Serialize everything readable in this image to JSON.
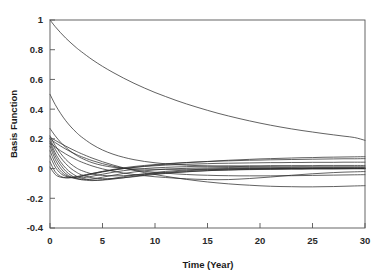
{
  "chart_data": {
    "type": "line",
    "title": "",
    "xlabel": "Time (Year)",
    "ylabel": "Basis Function",
    "xlim": [
      0,
      30
    ],
    "ylim": [
      -0.4,
      1.0
    ],
    "grid": false,
    "legend": "none",
    "line_color": "#2e2e2e",
    "axis_color": "#555555",
    "background_color": "#ffffff",
    "xticks": [
      0,
      5,
      10,
      15,
      20,
      25,
      30
    ],
    "xtick_labels": [
      "0",
      "5",
      "10",
      "15",
      "20",
      "25",
      "30"
    ],
    "yticks": [
      1,
      0.8,
      0.6,
      0.4,
      0.2,
      0,
      -0.2,
      -0.4
    ],
    "ytick_labels": [
      "1",
      "0.8",
      "0.6",
      "0.4",
      "0.2",
      "0",
      "-0.2",
      "-0.4"
    ],
    "x": [
      0,
      0.5,
      1,
      1.5,
      2,
      2.5,
      3,
      4,
      5,
      6,
      7,
      8,
      9,
      10,
      11,
      12,
      13,
      14,
      15,
      16,
      17,
      18,
      19,
      20,
      21,
      22,
      23,
      24,
      25,
      26,
      27,
      28,
      29,
      30
    ],
    "series": [
      {
        "name": "basis-1",
        "values": [
          1.0,
          0.955,
          0.915,
          0.878,
          0.845,
          0.814,
          0.786,
          0.734,
          0.688,
          0.647,
          0.609,
          0.574,
          0.542,
          0.512,
          0.485,
          0.459,
          0.435,
          0.413,
          0.392,
          0.372,
          0.354,
          0.337,
          0.321,
          0.306,
          0.292,
          0.279,
          0.267,
          0.256,
          0.246,
          0.236,
          0.227,
          0.218,
          0.209,
          0.19
        ]
      },
      {
        "name": "basis-2",
        "values": [
          0.5,
          0.43,
          0.372,
          0.322,
          0.28,
          0.244,
          0.213,
          0.163,
          0.125,
          0.097,
          0.076,
          0.06,
          0.048,
          0.039,
          0.032,
          0.027,
          0.023,
          0.02,
          0.018,
          0.016,
          0.015,
          0.014,
          0.013,
          0.012,
          0.012,
          0.011,
          0.011,
          0.011,
          0.01,
          0.01,
          0.01,
          0.01,
          0.01,
          0.01
        ]
      },
      {
        "name": "basis-3",
        "values": [
          0.27,
          0.22,
          0.178,
          0.143,
          0.114,
          0.09,
          0.07,
          0.04,
          0.021,
          0.009,
          0.002,
          -0.002,
          -0.004,
          -0.005,
          -0.005,
          -0.005,
          -0.004,
          -0.004,
          -0.003,
          -0.003,
          -0.002,
          -0.002,
          -0.001,
          -0.001,
          -0.001,
          0.0,
          0.0,
          0.0,
          0.0,
          0.0,
          0.0,
          0.0,
          0.0,
          0.0
        ]
      },
      {
        "name": "basis-4",
        "values": [
          0.22,
          0.155,
          0.103,
          0.062,
          0.03,
          0.005,
          -0.013,
          -0.036,
          -0.046,
          -0.049,
          -0.048,
          -0.044,
          -0.039,
          -0.034,
          -0.029,
          -0.025,
          -0.021,
          -0.017,
          -0.014,
          -0.012,
          -0.01,
          -0.008,
          -0.007,
          -0.006,
          -0.005,
          -0.004,
          -0.003,
          -0.003,
          -0.002,
          -0.002,
          -0.002,
          -0.001,
          -0.001,
          -0.001
        ]
      },
      {
        "name": "basis-5",
        "values": [
          0.2,
          0.13,
          0.075,
          0.033,
          0.0,
          -0.024,
          -0.042,
          -0.062,
          -0.068,
          -0.067,
          -0.062,
          -0.055,
          -0.047,
          -0.04,
          -0.033,
          -0.027,
          -0.022,
          -0.018,
          -0.014,
          -0.011,
          -0.009,
          -0.007,
          -0.006,
          -0.004,
          -0.003,
          -0.003,
          -0.002,
          -0.002,
          -0.001,
          -0.001,
          -0.001,
          -0.001,
          0.0,
          0.0
        ]
      },
      {
        "name": "basis-6",
        "values": [
          0.185,
          0.105,
          0.046,
          0.003,
          -0.028,
          -0.05,
          -0.064,
          -0.077,
          -0.077,
          -0.071,
          -0.062,
          -0.052,
          -0.042,
          -0.033,
          -0.026,
          -0.02,
          -0.015,
          -0.011,
          -0.008,
          -0.006,
          -0.004,
          -0.003,
          -0.002,
          -0.001,
          -0.001,
          0.0,
          0.0,
          0.0,
          0.001,
          0.001,
          0.001,
          0.001,
          0.001,
          0.001
        ]
      },
      {
        "name": "basis-7",
        "values": [
          0.17,
          0.085,
          0.026,
          -0.017,
          -0.046,
          -0.064,
          -0.075,
          -0.081,
          -0.076,
          -0.066,
          -0.055,
          -0.044,
          -0.034,
          -0.026,
          -0.019,
          -0.014,
          -0.01,
          -0.006,
          -0.004,
          -0.002,
          -0.001,
          0.0,
          0.001,
          0.002,
          0.002,
          0.003,
          0.003,
          0.003,
          0.003,
          0.004,
          0.004,
          0.004,
          0.004,
          0.004
        ]
      },
      {
        "name": "basis-8",
        "values": [
          0.15,
          0.062,
          0.004,
          -0.034,
          -0.057,
          -0.069,
          -0.074,
          -0.07,
          -0.058,
          -0.045,
          -0.033,
          -0.023,
          -0.015,
          -0.009,
          -0.004,
          -0.001,
          0.002,
          0.004,
          0.005,
          0.006,
          0.007,
          0.008,
          0.008,
          0.009,
          0.009,
          0.009,
          0.009,
          0.01,
          0.01,
          0.01,
          0.01,
          0.01,
          0.01,
          0.01
        ]
      },
      {
        "name": "basis-9",
        "values": [
          0.12,
          0.036,
          -0.016,
          -0.045,
          -0.06,
          -0.065,
          -0.063,
          -0.052,
          -0.038,
          -0.025,
          -0.014,
          -0.006,
          0.0,
          0.005,
          0.008,
          0.011,
          0.013,
          0.015,
          0.016,
          0.017,
          0.018,
          0.018,
          0.019,
          0.019,
          0.02,
          0.02,
          0.02,
          0.02,
          0.02,
          0.021,
          0.021,
          0.021,
          0.021,
          0.021
        ]
      },
      {
        "name": "basis-10",
        "values": [
          0.085,
          0.01,
          -0.032,
          -0.052,
          -0.059,
          -0.058,
          -0.053,
          -0.038,
          -0.023,
          -0.01,
          0.0,
          0.008,
          0.014,
          0.019,
          0.023,
          0.026,
          0.029,
          0.031,
          0.033,
          0.035,
          0.036,
          0.037,
          0.038,
          0.039,
          0.04,
          0.04,
          0.041,
          0.041,
          0.042,
          0.042,
          0.042,
          0.043,
          0.043,
          0.043
        ]
      },
      {
        "name": "basis-11",
        "values": [
          0.045,
          -0.022,
          -0.052,
          -0.062,
          -0.062,
          -0.057,
          -0.05,
          -0.034,
          -0.019,
          -0.006,
          0.005,
          0.014,
          0.021,
          0.027,
          0.032,
          0.037,
          0.041,
          0.044,
          0.047,
          0.05,
          0.052,
          0.054,
          0.056,
          0.057,
          0.059,
          0.06,
          0.061,
          0.062,
          0.063,
          0.064,
          0.065,
          0.066,
          0.066,
          0.067
        ]
      },
      {
        "name": "basis-12",
        "values": [
          0.01,
          -0.04,
          -0.058,
          -0.062,
          -0.059,
          -0.054,
          -0.047,
          -0.033,
          -0.02,
          -0.01,
          0.0,
          0.008,
          0.016,
          0.023,
          0.029,
          0.035,
          0.04,
          0.044,
          0.048,
          0.052,
          0.056,
          0.059,
          0.062,
          0.065,
          0.067,
          0.069,
          0.071,
          0.073,
          0.074,
          0.076,
          0.077,
          0.078,
          0.079,
          0.08
        ]
      },
      {
        "name": "basis-13",
        "values": [
          0.175,
          0.145,
          0.12,
          0.098,
          0.078,
          0.06,
          0.044,
          0.018,
          -0.002,
          -0.018,
          -0.03,
          -0.04,
          -0.048,
          -0.055,
          -0.06,
          -0.065,
          -0.069,
          -0.072,
          -0.074,
          -0.075,
          -0.074,
          -0.071,
          -0.067,
          -0.062,
          -0.057,
          -0.051,
          -0.045,
          -0.04,
          -0.035,
          -0.031,
          -0.027,
          -0.024,
          -0.022,
          -0.02
        ]
      },
      {
        "name": "basis-14",
        "values": [
          0.21,
          0.19,
          0.17,
          0.151,
          0.133,
          0.116,
          0.1,
          0.071,
          0.046,
          0.024,
          0.005,
          -0.012,
          -0.027,
          -0.04,
          -0.052,
          -0.063,
          -0.073,
          -0.082,
          -0.09,
          -0.097,
          -0.103,
          -0.108,
          -0.112,
          -0.116,
          -0.119,
          -0.121,
          -0.122,
          -0.123,
          -0.123,
          -0.122,
          -0.121,
          -0.119,
          -0.117,
          -0.115
        ]
      },
      {
        "name": "basis-15",
        "values": [
          0.2,
          0.175,
          0.152,
          0.131,
          0.112,
          0.095,
          0.08,
          0.054,
          0.033,
          0.016,
          0.002,
          -0.009,
          -0.018,
          -0.025,
          -0.031,
          -0.036,
          -0.04,
          -0.043,
          -0.045,
          -0.047,
          -0.048,
          -0.049,
          -0.049,
          -0.049,
          -0.049,
          -0.048,
          -0.048,
          -0.047,
          -0.046,
          -0.045,
          -0.044,
          -0.043,
          -0.042,
          -0.041
        ]
      }
    ]
  },
  "axes": {
    "ylabel": "Basis Function",
    "xlabel": "Time (Year)"
  }
}
